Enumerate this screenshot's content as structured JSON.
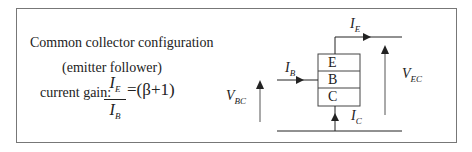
{
  "left_text": {
    "title": "Common collector configuration",
    "subtitle": "(emitter follower)",
    "gain_label": "current gain:",
    "gain_numerator": "I",
    "gain_numerator_sub": "E",
    "gain_denominator": "I",
    "gain_denominator_sub": "B",
    "gain_rhs": "=(β+1)"
  },
  "diagram": {
    "terminals": [
      "E",
      "B",
      "C"
    ],
    "labels": {
      "IE": {
        "main": "I",
        "sub": "E"
      },
      "IB": {
        "main": "I",
        "sub": "B"
      },
      "IC": {
        "main": "I",
        "sub": "C"
      },
      "VBC": {
        "main": "V",
        "sub": "BC"
      },
      "VEC": {
        "main": "V",
        "sub": "EC"
      }
    },
    "colors": {
      "line": "#222222",
      "voltage_arrow": "#555555",
      "frame": "#777777"
    }
  }
}
